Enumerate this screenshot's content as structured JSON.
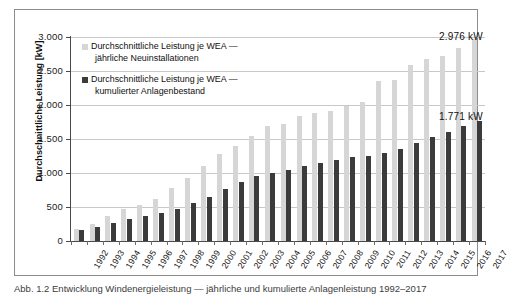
{
  "figure": {
    "caption": "Abb. 1.2  Entwicklung Windenergieleistung — jährliche und kumulierte Anlagenleistung 1992–2017"
  },
  "annotations": {
    "new_top_label": "2.976 kW",
    "cumulative_top_label": "1.771 kW"
  },
  "colors": {
    "series_new": "#d6d6d6",
    "series_cumulative": "#3b3b3b",
    "gridline": "#c8c8c8",
    "axis": "#4a4a4a",
    "frame": "#8d8d8d"
  },
  "chart_data": {
    "type": "bar",
    "title": "",
    "xlabel": "",
    "ylabel": "Durchschnittliche Leistung [kW]",
    "ylim": [
      0,
      3000
    ],
    "yticks": [
      0,
      500,
      1000,
      1500,
      2000,
      2500,
      3000
    ],
    "ytick_labels": [
      "0",
      "500",
      "1.000",
      "1.500",
      "2.000",
      "2.500",
      "3.000"
    ],
    "grid": true,
    "legend_position": "inside-top-left",
    "categories": [
      "1992",
      "1993",
      "1994",
      "1995",
      "1996",
      "1997",
      "1998",
      "1999",
      "2000",
      "2001",
      "2002",
      "2003",
      "2004",
      "2005",
      "2006",
      "2007",
      "2008",
      "2009",
      "2010",
      "2011",
      "2012",
      "2013",
      "2014",
      "2015",
      "2016",
      "2017"
    ],
    "series": [
      {
        "name": "Durchschnittliche Leistung  je WEA — jährliche Neuinstallationen",
        "key": "new",
        "values": [
          170,
          255,
          365,
          470,
          530,
          625,
          780,
          925,
          1105,
          1275,
          1395,
          1545,
          1690,
          1720,
          1845,
          1885,
          1915,
          1990,
          2045,
          2350,
          2375,
          2590,
          2670,
          2715,
          2845,
          2976
        ]
      },
      {
        "name": "Durchschnittliche Leistung  je WEA — kumulierter Anlagenbestand",
        "key": "cumulative",
        "values": [
          165,
          205,
          260,
          325,
          365,
          410,
          475,
          560,
          650,
          765,
          875,
          950,
          1005,
          1050,
          1110,
          1150,
          1185,
          1230,
          1255,
          1300,
          1350,
          1435,
          1530,
          1605,
          1685,
          1771
        ]
      }
    ]
  },
  "legend": {
    "entries": [
      {
        "line1": "Durchschnittliche Leistung  je WEA —",
        "line2": "jährliche Neuinstallationen"
      },
      {
        "line1": "Durchschnittliche Leistung  je WEA —",
        "line2": "kumulierter Anlagenbestand"
      }
    ]
  }
}
